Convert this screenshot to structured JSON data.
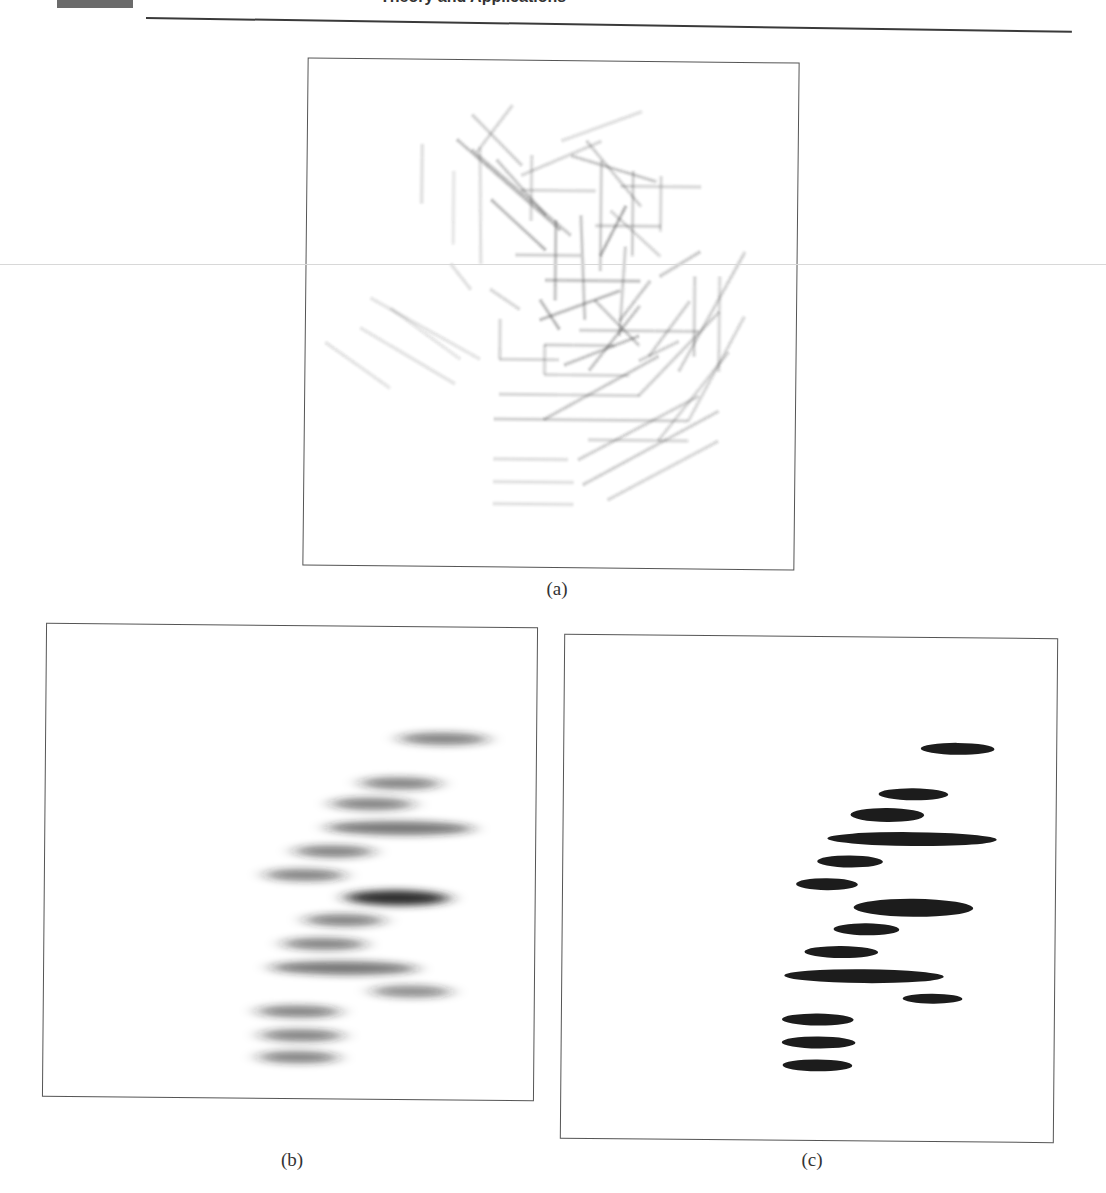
{
  "header": {
    "title_fragment": "Theory and Applications",
    "block_color": "#6b6b6b",
    "rule_color": "#3a3a3a"
  },
  "figure": {
    "panels": [
      {
        "id": "a",
        "caption": "(a)",
        "description": "Overlaid blurred line-segment (edge) map"
      },
      {
        "id": "b",
        "caption": "(b)",
        "description": "Gaussian-blurred horizontal ellipses"
      },
      {
        "id": "c",
        "caption": "(c)",
        "description": "Thresholded black horizontal ellipses"
      }
    ]
  },
  "panel_a_segments": [
    [
      420,
      145,
      420,
      205,
      0.25
    ],
    [
      452,
      172,
      452,
      245,
      0.2
    ],
    [
      475,
      152,
      510,
      105,
      0.3
    ],
    [
      470,
      115,
      520,
      165,
      0.35
    ],
    [
      455,
      140,
      560,
      230,
      0.45
    ],
    [
      490,
      200,
      545,
      250,
      0.5
    ],
    [
      495,
      160,
      545,
      215,
      0.4
    ],
    [
      520,
      175,
      600,
      140,
      0.3
    ],
    [
      530,
      155,
      530,
      220,
      0.3
    ],
    [
      560,
      140,
      640,
      110,
      0.25
    ],
    [
      570,
      155,
      655,
      180,
      0.4
    ],
    [
      585,
      140,
      640,
      205,
      0.35
    ],
    [
      620,
      185,
      700,
      185,
      0.3
    ],
    [
      632,
      170,
      632,
      255,
      0.35
    ],
    [
      610,
      210,
      660,
      255,
      0.3
    ],
    [
      595,
      225,
      660,
      225,
      0.35
    ],
    [
      555,
      220,
      555,
      300,
      0.45
    ],
    [
      580,
      215,
      585,
      320,
      0.4
    ],
    [
      600,
      255,
      625,
      205,
      0.55
    ],
    [
      545,
      280,
      640,
      280,
      0.45
    ],
    [
      540,
      300,
      560,
      330,
      0.5
    ],
    [
      540,
      320,
      620,
      290,
      0.5
    ],
    [
      595,
      300,
      640,
      345,
      0.4
    ],
    [
      620,
      335,
      625,
      245,
      0.35
    ],
    [
      580,
      330,
      700,
      330,
      0.35
    ],
    [
      620,
      320,
      650,
      280,
      0.4
    ],
    [
      660,
      275,
      700,
      250,
      0.4
    ],
    [
      695,
      275,
      695,
      355,
      0.35
    ],
    [
      720,
      275,
      720,
      370,
      0.3
    ],
    [
      680,
      370,
      745,
      250,
      0.35
    ],
    [
      650,
      355,
      690,
      300,
      0.35
    ],
    [
      545,
      345,
      615,
      345,
      0.35
    ],
    [
      545,
      345,
      545,
      375,
      0.3
    ],
    [
      545,
      375,
      630,
      375,
      0.3
    ],
    [
      590,
      370,
      640,
      305,
      0.45
    ],
    [
      565,
      365,
      640,
      335,
      0.45
    ],
    [
      500,
      320,
      500,
      360,
      0.3
    ],
    [
      500,
      360,
      560,
      360,
      0.3
    ],
    [
      490,
      290,
      520,
      310,
      0.3
    ],
    [
      325,
      345,
      390,
      390,
      0.22
    ],
    [
      360,
      330,
      455,
      385,
      0.22
    ],
    [
      370,
      300,
      480,
      360,
      0.22
    ],
    [
      390,
      310,
      460,
      360,
      0.2
    ],
    [
      500,
      395,
      640,
      395,
      0.3
    ],
    [
      495,
      420,
      690,
      420,
      0.35
    ],
    [
      590,
      440,
      690,
      440,
      0.3
    ],
    [
      495,
      460,
      570,
      460,
      0.25
    ],
    [
      495,
      483,
      575,
      483,
      0.25
    ],
    [
      495,
      505,
      575,
      505,
      0.25
    ],
    [
      545,
      420,
      660,
      355,
      0.4
    ],
    [
      580,
      460,
      700,
      395,
      0.35
    ],
    [
      585,
      485,
      720,
      410,
      0.35
    ],
    [
      610,
      500,
      720,
      440,
      0.3
    ],
    [
      640,
      395,
      720,
      310,
      0.35
    ],
    [
      660,
      440,
      730,
      350,
      0.3
    ],
    [
      690,
      420,
      745,
      315,
      0.3
    ],
    [
      640,
      360,
      680,
      340,
      0.35
    ],
    [
      450,
      265,
      470,
      290,
      0.25
    ],
    [
      515,
      255,
      580,
      255,
      0.35
    ],
    [
      520,
      190,
      595,
      190,
      0.3
    ],
    [
      478,
      148,
      480,
      265,
      0.25
    ],
    [
      470,
      150,
      570,
      235,
      0.4
    ],
    [
      600,
      160,
      600,
      270,
      0.35
    ],
    [
      660,
      175,
      660,
      230,
      0.3
    ]
  ],
  "panel_b_ellipses": [
    {
      "cx": 443,
      "cy": 737,
      "rx": 56,
      "ry": 9,
      "darkness": 0.55
    },
    {
      "cx": 400,
      "cy": 782,
      "rx": 50,
      "ry": 9,
      "darkness": 0.55
    },
    {
      "cx": 372,
      "cy": 803,
      "rx": 52,
      "ry": 9,
      "darkness": 0.55
    },
    {
      "cx": 400,
      "cy": 827,
      "rx": 92,
      "ry": 10,
      "darkness": 0.6
    },
    {
      "cx": 334,
      "cy": 851,
      "rx": 50,
      "ry": 9,
      "darkness": 0.55
    },
    {
      "cx": 305,
      "cy": 875,
      "rx": 50,
      "ry": 9,
      "darkness": 0.55
    },
    {
      "cx": 398,
      "cy": 897,
      "rx": 65,
      "ry": 11,
      "darkness": 0.95
    },
    {
      "cx": 345,
      "cy": 920,
      "rx": 50,
      "ry": 9,
      "darkness": 0.55
    },
    {
      "cx": 325,
      "cy": 944,
      "rx": 52,
      "ry": 9,
      "darkness": 0.55
    },
    {
      "cx": 345,
      "cy": 968,
      "rx": 92,
      "ry": 10,
      "darkness": 0.6
    },
    {
      "cx": 413,
      "cy": 991,
      "rx": 50,
      "ry": 9,
      "darkness": 0.5
    },
    {
      "cx": 300,
      "cy": 1012,
      "rx": 52,
      "ry": 9,
      "darkness": 0.55
    },
    {
      "cx": 303,
      "cy": 1036,
      "rx": 52,
      "ry": 9,
      "darkness": 0.55
    },
    {
      "cx": 300,
      "cy": 1058,
      "rx": 50,
      "ry": 9,
      "darkness": 0.55
    }
  ],
  "panel_c_ellipses": [
    {
      "cx": 957,
      "cy": 747,
      "rx": 37,
      "ry": 6
    },
    {
      "cx": 913,
      "cy": 793,
      "rx": 35,
      "ry": 6
    },
    {
      "cx": 887,
      "cy": 814,
      "rx": 37,
      "ry": 7
    },
    {
      "cx": 912,
      "cy": 838,
      "rx": 85,
      "ry": 7
    },
    {
      "cx": 850,
      "cy": 861,
      "rx": 33,
      "ry": 6
    },
    {
      "cx": 827,
      "cy": 884,
      "rx": 31,
      "ry": 6
    },
    {
      "cx": 914,
      "cy": 907,
      "rx": 60,
      "ry": 9
    },
    {
      "cx": 867,
      "cy": 929,
      "rx": 33,
      "ry": 6
    },
    {
      "cx": 842,
      "cy": 952,
      "rx": 37,
      "ry": 6
    },
    {
      "cx": 865,
      "cy": 976,
      "rx": 80,
      "ry": 7
    },
    {
      "cx": 934,
      "cy": 998,
      "rx": 30,
      "ry": 5
    },
    {
      "cx": 819,
      "cy": 1020,
      "rx": 36,
      "ry": 6
    },
    {
      "cx": 820,
      "cy": 1043,
      "rx": 37,
      "ry": 6
    },
    {
      "cx": 819,
      "cy": 1066,
      "rx": 35,
      "ry": 6
    }
  ]
}
